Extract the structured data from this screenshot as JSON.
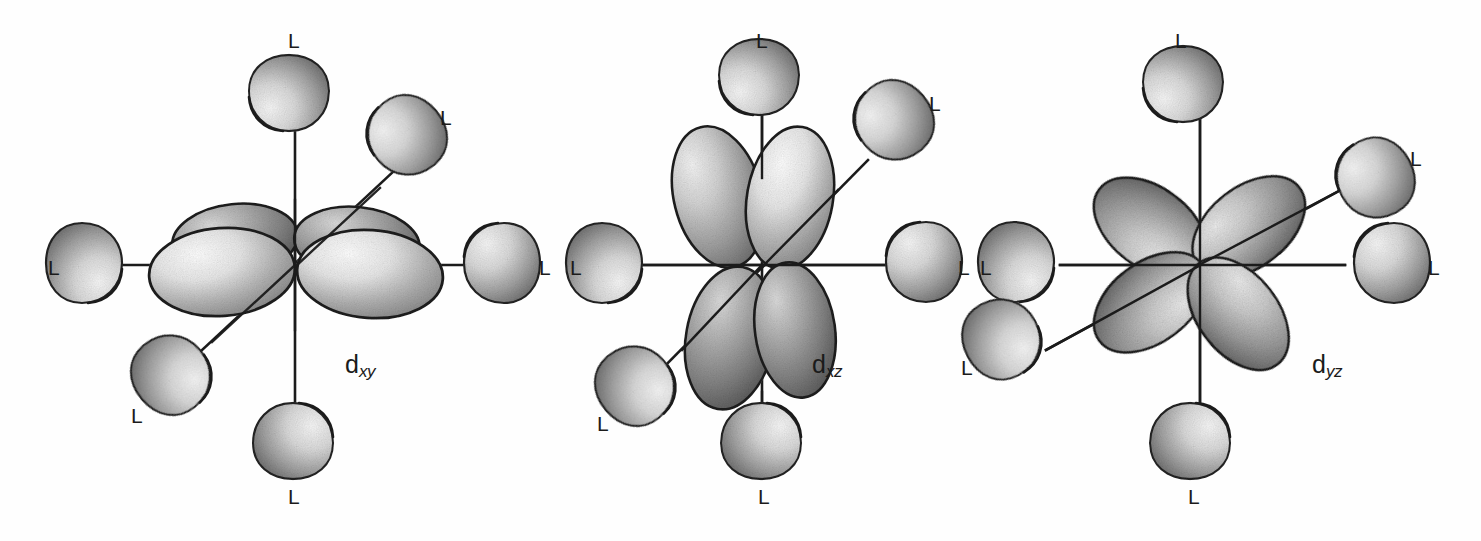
{
  "figure": {
    "background_color": "#fefefe",
    "ink_color": "#1b1b1b",
    "ligand_label": "L",
    "panel_count": 3
  },
  "panels": [
    {
      "id": "dxy",
      "orbital_symbol": "d",
      "orbital_subscript": "xy",
      "label_x": 345,
      "label_y": 352,
      "center": {
        "x": 295,
        "y": 265
      },
      "orbital_type": "four-lobe-in-plane-edge-on",
      "lobe_count": 4,
      "axes": [
        {
          "name": "horizontal-axis",
          "angle_deg": 0
        },
        {
          "name": "vertical-axis",
          "angle_deg": 90
        },
        {
          "name": "diagonal-axis",
          "angle_deg": 42
        }
      ],
      "ligands": [
        {
          "name": "ligand-top",
          "label": "L",
          "label_x": 288,
          "label_y": 30,
          "lobe_cx": 289,
          "lobe_cy": 97,
          "angle_deg": 90
        },
        {
          "name": "ligand-bottom",
          "label": "L",
          "label_x": 288,
          "label_y": 486,
          "lobe_cx": 293,
          "lobe_cy": 437,
          "angle_deg": 270
        },
        {
          "name": "ligand-left",
          "label": "L",
          "label_x": 48,
          "label_y": 257,
          "lobe_cx": 88,
          "lobe_cy": 263,
          "angle_deg": 180
        },
        {
          "name": "ligand-right",
          "label": "L",
          "label_x": 539,
          "label_y": 257,
          "lobe_cx": 498,
          "lobe_cy": 263,
          "angle_deg": 0
        },
        {
          "name": "ligand-upper-right-diagonal",
          "label": "L",
          "label_x": 440,
          "label_y": 107,
          "lobe_cx": 404,
          "lobe_cy": 138,
          "angle_deg": 42
        },
        {
          "name": "ligand-lower-left-diagonal",
          "label": "L",
          "label_x": 131,
          "label_y": 405,
          "lobe_cx": 174,
          "lobe_cy": 372,
          "angle_deg": 222
        }
      ]
    },
    {
      "id": "dxz",
      "orbital_symbol": "d",
      "orbital_subscript": "xz",
      "label_x": 812,
      "label_y": 352,
      "center": {
        "x": 762,
        "y": 266
      },
      "orbital_type": "four-lobe-vertical-plane-edge-on",
      "lobe_count": 4,
      "axes": [
        {
          "name": "horizontal-axis",
          "angle_deg": 0
        },
        {
          "name": "vertical-axis",
          "angle_deg": 90
        },
        {
          "name": "diagonal-axis",
          "angle_deg": 42
        }
      ],
      "ligands": [
        {
          "name": "ligand-top",
          "label": "L",
          "label_x": 756,
          "label_y": 30,
          "lobe_cx": 759,
          "lobe_cy": 81,
          "angle_deg": 90
        },
        {
          "name": "ligand-bottom",
          "label": "L",
          "label_x": 758,
          "label_y": 486,
          "lobe_cx": 761,
          "lobe_cy": 437,
          "angle_deg": 270
        },
        {
          "name": "ligand-left",
          "label": "L",
          "label_x": 570,
          "label_y": 257,
          "lobe_cx": 608,
          "lobe_cy": 263,
          "angle_deg": 180
        },
        {
          "name": "ligand-right",
          "label": "L",
          "label_x": 958,
          "label_y": 257,
          "lobe_cx": 920,
          "lobe_cy": 262,
          "angle_deg": 0
        },
        {
          "name": "ligand-upper-right-diagonal",
          "label": "L",
          "label_x": 929,
          "label_y": 93,
          "lobe_cx": 891,
          "lobe_cy": 123,
          "angle_deg": 42
        },
        {
          "name": "ligand-lower-left-diagonal",
          "label": "L",
          "label_x": 597,
          "label_y": 413,
          "lobe_cx": 638,
          "lobe_cy": 383,
          "angle_deg": 222
        }
      ]
    },
    {
      "id": "dyz",
      "orbital_symbol": "d",
      "orbital_subscript": "yz",
      "label_x": 1312,
      "label_y": 352,
      "center": {
        "x": 1200,
        "y": 265
      },
      "orbital_type": "four-lobe-clover-45deg",
      "lobe_count": 4,
      "axes": [
        {
          "name": "horizontal-axis",
          "angle_deg": 0
        },
        {
          "name": "vertical-axis",
          "angle_deg": 90
        },
        {
          "name": "diagonal-axis",
          "angle_deg": 32
        }
      ],
      "ligands": [
        {
          "name": "ligand-top",
          "label": "L",
          "label_x": 1175,
          "label_y": 30,
          "lobe_cx": 1183,
          "lobe_cy": 88,
          "angle_deg": 90
        },
        {
          "name": "ligand-bottom",
          "label": "L",
          "label_x": 1188,
          "label_y": 486,
          "lobe_cx": 1190,
          "lobe_cy": 437,
          "angle_deg": 270
        },
        {
          "name": "ligand-left",
          "label": "L",
          "label_x": 980,
          "label_y": 257,
          "lobe_cx": 1020,
          "lobe_cy": 262,
          "angle_deg": 180
        },
        {
          "name": "ligand-right",
          "label": "L",
          "label_x": 1428,
          "label_y": 257,
          "lobe_cx": 1388,
          "lobe_cy": 263,
          "angle_deg": 0
        },
        {
          "name": "ligand-upper-right-diagonal",
          "label": "L",
          "label_x": 1410,
          "label_y": 148,
          "lobe_cx": 1372,
          "lobe_cy": 180,
          "angle_deg": 32
        },
        {
          "name": "ligand-lower-left-diagonal",
          "label": "L",
          "label_x": 961,
          "label_y": 357,
          "lobe_cx": 1005,
          "lobe_cy": 337,
          "angle_deg": 212
        }
      ]
    }
  ]
}
